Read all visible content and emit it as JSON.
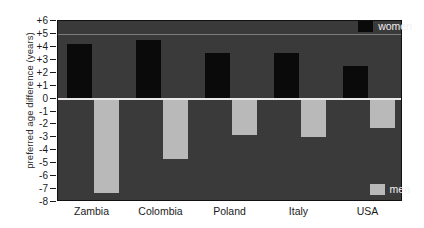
{
  "chart_data": {
    "type": "bar",
    "title": "",
    "subtitle": "",
    "xlabel": "",
    "ylabel": "preferred age difference (years)",
    "categories": [
      "Zambia",
      "Colombia",
      "Poland",
      "Italy",
      "USA"
    ],
    "series": [
      {
        "name": "women",
        "color": "#0a0a0a",
        "values": [
          4.2,
          4.5,
          3.5,
          3.5,
          2.5
        ]
      },
      {
        "name": "men",
        "color": "#b9b9b9",
        "values": [
          -7.3,
          -4.7,
          -2.8,
          -3.0,
          -2.3
        ]
      }
    ],
    "ylim": [
      -8,
      6
    ],
    "ytick_labels": [
      "+6",
      "+5",
      "+4",
      "+3",
      "+2",
      "+1",
      "0",
      "-1",
      "-2",
      "-3",
      "-4",
      "-5",
      "-6",
      "-7",
      "-8"
    ],
    "ytick_values": [
      6,
      5,
      4,
      3,
      2,
      1,
      0,
      -1,
      -2,
      -3,
      -4,
      -5,
      -6,
      -7,
      -8
    ],
    "grid": true,
    "gridlines_at": [
      5
    ],
    "zero_line": 0,
    "legend_position": "right",
    "plot_background": "#3a3a3a",
    "page_background": "#ffffff"
  },
  "legend": {
    "women_label": "women",
    "men_label": "men"
  }
}
